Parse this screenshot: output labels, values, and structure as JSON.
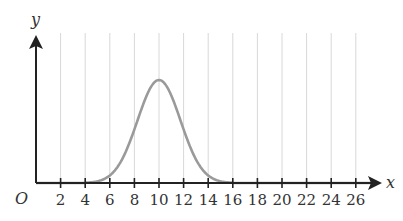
{
  "chart_data": {
    "type": "line",
    "title": "",
    "xlabel": "x",
    "ylabel": "y",
    "origin_label": "O",
    "x_ticks": [
      2,
      4,
      6,
      8,
      10,
      12,
      14,
      16,
      18,
      20,
      22,
      24,
      26
    ],
    "x_tick_labels": [
      "2",
      "4",
      "6",
      "8",
      "10",
      "12",
      "14",
      "16",
      "18",
      "20",
      "22",
      "24",
      "26"
    ],
    "xlim": [
      0,
      28
    ],
    "grid": {
      "vertical": true,
      "horizontal": false
    },
    "series": [
      {
        "name": "bell curve",
        "shape": "normal",
        "mean": 10,
        "support": [
          4,
          16
        ],
        "peak_x": 10,
        "color": "#9a9a9a"
      }
    ],
    "colors": {
      "axis": "#222222",
      "grid": "#d8d8d8",
      "curve": "#9a9a9a"
    }
  }
}
